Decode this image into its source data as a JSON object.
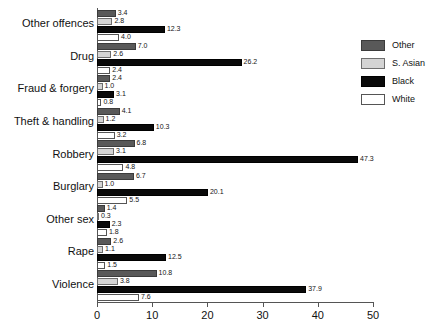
{
  "chart_data": {
    "type": "bar",
    "orientation": "horizontal",
    "title": "",
    "subtitle": "",
    "xlabel": "",
    "ylabel": "",
    "xlim": [
      0,
      50
    ],
    "xticks": [
      0,
      10,
      20,
      30,
      40,
      50
    ],
    "xtick_labels": [
      "0",
      "10",
      "20",
      "30",
      "40",
      "50"
    ],
    "grid": false,
    "legend_position": "right",
    "categories": [
      "Other offences",
      "Drug",
      "Fraud & forgery",
      "Theft & handling",
      "Robbery",
      "Burglary",
      "Other sex",
      "Rape",
      "Violence"
    ],
    "series": [
      {
        "name": "Other",
        "color": "#595959",
        "values": [
          3.4,
          7.0,
          2.4,
          4.1,
          6.8,
          6.7,
          1.4,
          2.6,
          10.8
        ]
      },
      {
        "name": "S. Asian",
        "color": "#d4d4d4",
        "values": [
          2.8,
          2.6,
          1.0,
          1.2,
          3.1,
          1.0,
          0.3,
          1.1,
          3.8
        ]
      },
      {
        "name": "Black",
        "color": "#0a0a0a",
        "values": [
          12.3,
          26.2,
          3.1,
          10.3,
          47.3,
          20.1,
          2.3,
          12.5,
          37.9
        ]
      },
      {
        "name": "White",
        "color": "#ffffff",
        "values": [
          4.0,
          2.4,
          0.8,
          3.2,
          4.8,
          5.5,
          1.8,
          1.5,
          7.6
        ]
      }
    ],
    "value_labels": [
      [
        "3.4",
        "2.8",
        "12.3",
        "4.0"
      ],
      [
        "7.0",
        "2.6",
        "26.2",
        "2.4"
      ],
      [
        "2.4",
        "1.0",
        "3.1",
        "0.8"
      ],
      [
        "4.1",
        "1.2",
        "10.3",
        "3.2"
      ],
      [
        "6.8",
        "3.1",
        "47.3",
        "4.8"
      ],
      [
        "6.7",
        "1.0",
        "20.1",
        "5.5"
      ],
      [
        "1.4",
        "0.3",
        "2.3",
        "1.8"
      ],
      [
        "2.6",
        "1.1",
        "12.5",
        "1.5"
      ],
      [
        "10.8",
        "3.8",
        "37.9",
        "7.6"
      ]
    ]
  },
  "legend": {
    "items": [
      {
        "label": "Other",
        "swatch": "other"
      },
      {
        "label": "S. Asian",
        "swatch": "sasian"
      },
      {
        "label": "Black",
        "swatch": "black"
      },
      {
        "label": "White",
        "swatch": "white"
      }
    ]
  }
}
